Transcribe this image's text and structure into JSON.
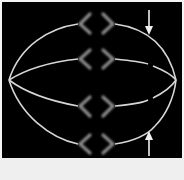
{
  "figure": {
    "colors": {
      "background": "#000000",
      "spindle_fibers": "#d8d8d8",
      "chromosomes": "#8a8a8a",
      "arrows": "#f0f0f0",
      "lower_strip": "#efefef"
    },
    "spindle_fibers": 4,
    "chromosome_pairs": 4,
    "arrows": [
      {
        "direction": "down",
        "position": "top-right"
      },
      {
        "direction": "up",
        "position": "bottom-right"
      }
    ]
  }
}
